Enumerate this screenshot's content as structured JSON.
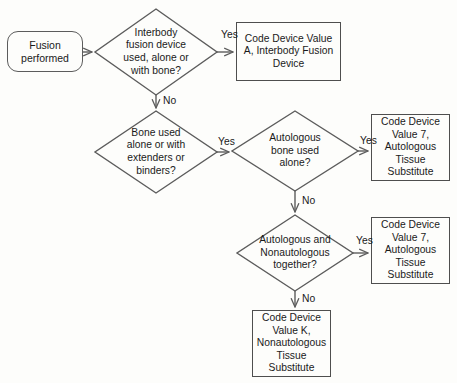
{
  "diagram": {
    "colors": {
      "background": "#fdfdfb",
      "stroke": "#5c5c5c",
      "text": "#1a1a1a"
    },
    "nodes": [
      {
        "id": "start",
        "shape": "terminator",
        "text": "Fusion\nperformed",
        "x": 7,
        "y": 31,
        "w": 76,
        "h": 41,
        "font": 10.5
      },
      {
        "id": "d1",
        "shape": "diamond",
        "text": "Interbody\nfusion device\nused, alone or\nwith bone?",
        "cx": 156,
        "cy": 52,
        "rx": 61,
        "ry": 43,
        "font": 10.3
      },
      {
        "id": "b1",
        "shape": "process",
        "text": "Code Device Value\nA, Interbody Fusion\nDevice",
        "x": 236,
        "y": 22,
        "w": 105,
        "h": 59,
        "font": 10.3
      },
      {
        "id": "d2",
        "shape": "diamond",
        "text": "Bone used\nalone or with\nextenders or\nbinders?",
        "cx": 156,
        "cy": 152,
        "rx": 61,
        "ry": 41,
        "font": 10.3
      },
      {
        "id": "d3",
        "shape": "diamond",
        "text": "Autologous\nbone used\nalone?",
        "cx": 295,
        "cy": 151,
        "rx": 63,
        "ry": 40,
        "font": 10.3
      },
      {
        "id": "b2",
        "shape": "process",
        "text": "Code Device\nValue 7,\nAutologous\nTissue\nSubstitute",
        "x": 371,
        "y": 114,
        "w": 79,
        "h": 67,
        "font": 10.3
      },
      {
        "id": "d4",
        "shape": "diamond",
        "text": "Autologous and\nNonautologous\ntogether?",
        "cx": 295,
        "cy": 253,
        "rx": 58,
        "ry": 38,
        "font": 10.3
      },
      {
        "id": "b3",
        "shape": "process",
        "text": "Code Device\nValue 7,\nAutologous\nTissue\nSubstitute",
        "x": 371,
        "y": 217,
        "w": 79,
        "h": 67,
        "font": 10.3
      },
      {
        "id": "b4",
        "shape": "process",
        "text": "Code Device\nValue K,\nNonautologous\nTissue\nSubstitute",
        "x": 252,
        "y": 310,
        "w": 79,
        "h": 67,
        "font": 10.3
      }
    ],
    "edge_labels": [
      {
        "id": "d1-yes",
        "text": "Yes",
        "x": 221,
        "y": 30,
        "font": 10.3
      },
      {
        "id": "d1-no",
        "text": "No",
        "x": 163,
        "y": 96,
        "font": 10.3
      },
      {
        "id": "d2-yes",
        "text": "Yes",
        "x": 218,
        "y": 137,
        "font": 10.3
      },
      {
        "id": "d3-yes",
        "text": "Yes",
        "x": 360,
        "y": 136,
        "font": 10.3
      },
      {
        "id": "d3-no",
        "text": "No",
        "x": 302,
        "y": 196,
        "font": 10.3
      },
      {
        "id": "d4-yes",
        "text": "Yes",
        "x": 356,
        "y": 236,
        "font": 10.3
      },
      {
        "id": "d4-no",
        "text": "No",
        "x": 302,
        "y": 294,
        "font": 10.3
      }
    ]
  }
}
